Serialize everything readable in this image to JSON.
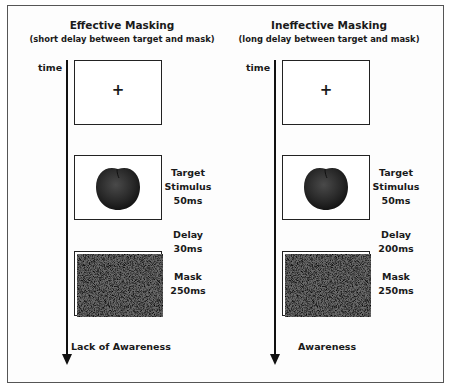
{
  "panels": [
    {
      "title": "Effective Masking",
      "subtitle": "(short delay between target and mask)",
      "axis_label": "time",
      "fixation_symbol": "+",
      "stages": [
        {
          "name": "Target Stimulus",
          "line1": "Target",
          "line2": "Stimulus",
          "duration": "50ms",
          "image": "apple-icon"
        },
        {
          "name": "Delay",
          "line1": "Delay",
          "duration": "30ms"
        },
        {
          "name": "Mask",
          "line1": "Mask",
          "duration": "250ms",
          "image": "noise-mask"
        }
      ],
      "outcome": "Lack of Awareness"
    },
    {
      "title": "Ineffective Masking",
      "subtitle": "(long delay between target and mask)",
      "axis_label": "time",
      "fixation_symbol": "+",
      "stages": [
        {
          "name": "Target Stimulus",
          "line1": "Target",
          "line2": "Stimulus",
          "duration": "50ms",
          "image": "apple-icon"
        },
        {
          "name": "Delay",
          "line1": "Delay",
          "duration": "200ms"
        },
        {
          "name": "Mask",
          "line1": "Mask",
          "duration": "250ms",
          "image": "noise-mask"
        }
      ],
      "outcome": "Awareness"
    }
  ],
  "colors": {
    "line": "#111111",
    "frame": "#555555",
    "apple": "#2b2b2b"
  }
}
